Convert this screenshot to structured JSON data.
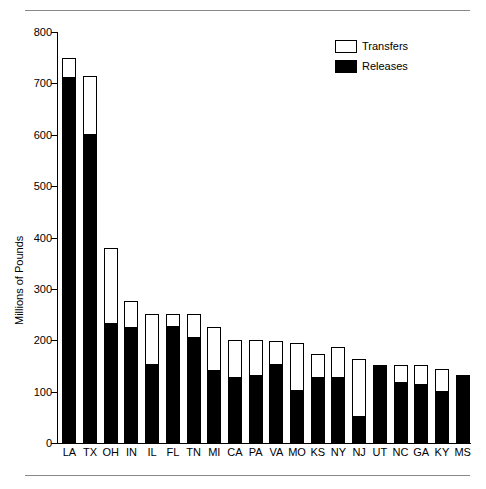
{
  "chart_data": {
    "type": "bar",
    "subtype": "stacked-vertical",
    "title": "",
    "xlabel": "",
    "ylabel": "Millions of Pounds",
    "ylim": [
      0,
      800
    ],
    "yticks": [
      0,
      100,
      200,
      300,
      400,
      500,
      600,
      700,
      800
    ],
    "ytick_labels": [
      "0",
      "100",
      "200",
      "300",
      "400",
      "500",
      "600",
      "700",
      "800"
    ],
    "grid": false,
    "legend_position": "top-right",
    "categories": [
      "LA",
      "TX",
      "OH",
      "IN",
      "IL",
      "FL",
      "TN",
      "MI",
      "CA",
      "PA",
      "VA",
      "MO",
      "KS",
      "NY",
      "NJ",
      "UT",
      "NC",
      "GA",
      "KY",
      "MS"
    ],
    "series": [
      {
        "name": "Releases",
        "color": "#000000",
        "values": [
          710,
          600,
          231,
          224,
          151,
          225,
          205,
          141,
          126,
          131,
          151,
          101,
          126,
          126,
          50,
          152,
          116,
          112,
          99,
          130
        ]
      },
      {
        "name": "Transfers",
        "color": "#ffffff",
        "values": [
          40,
          115,
          149,
          52,
          101,
          26,
          46,
          84,
          74,
          70,
          48,
          94,
          48,
          60,
          113,
          0,
          36,
          39,
          46,
          3
        ]
      }
    ],
    "totals": [
      750,
      715,
      380,
      276,
      252,
      251,
      251,
      225,
      200,
      201,
      199,
      195,
      174,
      186,
      163,
      152,
      152,
      151,
      145,
      133
    ]
  },
  "legend": {
    "entries": [
      {
        "label": "Transfers",
        "swatch": "white"
      },
      {
        "label": "Releases",
        "swatch": "black"
      }
    ]
  }
}
